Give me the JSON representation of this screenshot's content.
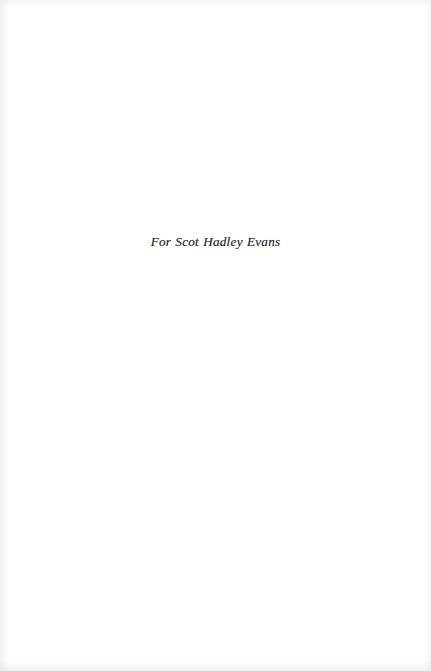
{
  "page": {
    "kind": "book-dedication-page",
    "width": 431,
    "height": 671,
    "background_color": "#ffffff",
    "text_color": "#2b2a2a"
  },
  "dedication": {
    "text": "For Scot Hadley Evans"
  }
}
